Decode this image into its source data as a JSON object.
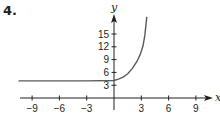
{
  "problem_number": "4.",
  "colors": {
    "axis": "#231f20",
    "curve": "#58595b"
  },
  "chart_data": {
    "type": "line",
    "title": "",
    "xlabel": "x",
    "ylabel": "y",
    "xlim": [
      -10,
      10
    ],
    "ylim": [
      0,
      19
    ],
    "grid": false,
    "x_ticks": [
      -9,
      -6,
      -3,
      3,
      6,
      9
    ],
    "y_ticks": [
      3,
      6,
      9,
      12,
      15
    ],
    "x_tick_labels": [
      "−9",
      "−6",
      "−3",
      "3",
      "6",
      "9"
    ],
    "y_tick_labels": [
      "3",
      "6",
      "9",
      "12",
      "15"
    ],
    "series": [
      {
        "name": "curve",
        "asymptote_y": 4,
        "points": [
          {
            "x": -10.5,
            "y": 4.0
          },
          {
            "x": -3,
            "y": 4.0
          },
          {
            "x": 0,
            "y": 4.1
          },
          {
            "x": 0.5,
            "y": 4.4
          },
          {
            "x": 1,
            "y": 4.9
          },
          {
            "x": 1.5,
            "y": 5.7
          },
          {
            "x": 2,
            "y": 6.9
          },
          {
            "x": 2.5,
            "y": 8.5
          },
          {
            "x": 2.9,
            "y": 10.3
          },
          {
            "x": 3.2,
            "y": 12.3
          },
          {
            "x": 3.4,
            "y": 14.8
          },
          {
            "x": 3.6,
            "y": 19.0
          }
        ]
      }
    ]
  }
}
